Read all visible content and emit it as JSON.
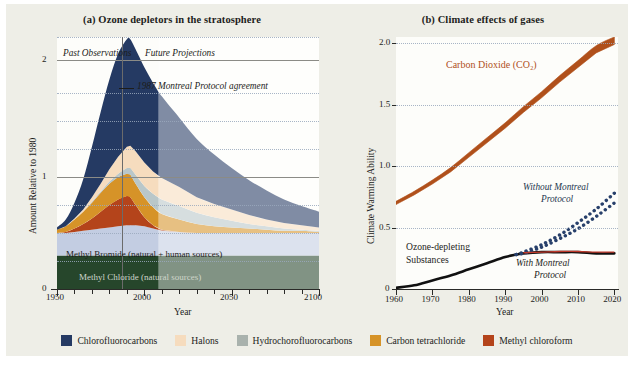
{
  "figure": {
    "background": "#eeeee7",
    "plot_background": "#fdfdfa"
  },
  "panel_a": {
    "title": "(a) Ozone depletors in the stratosphere",
    "xlabel": "Year",
    "ylabel": "Amount Relative to 1980",
    "annotations": {
      "past": "Past Observations",
      "future": "Future Projections",
      "protocol": "1987 Montreal Protocol agreement",
      "methyl_bromide": "Methyl Bromide (natural + human sources)",
      "methyl_chloride": "Methyl Chloride (natural sources)"
    },
    "divider_year": 1987,
    "projection_start_year": 2008
  },
  "panel_b": {
    "title": "(b) Climate effects of gases",
    "xlabel": "Year",
    "ylabel": "Climate Warming Ability",
    "annotations": {
      "co2": "Carbon Dioxide (CO₂)",
      "co2_color": "#b0501b",
      "without": "Without Montreal",
      "without2": "Protocol",
      "with": "With Montreal",
      "with2": "Protocol",
      "ods": "Ozone-depleting",
      "ods2": "Substances"
    }
  },
  "legend": [
    {
      "label": "Chlorofluorocarbons",
      "color": "#253a63"
    },
    {
      "label": "Halons",
      "color": "#f6dcbe"
    },
    {
      "label": "Hydrochorofluorocarbons",
      "color": "#a9b2ad"
    },
    {
      "label": "Carbon tetrachloride",
      "color": "#d69328"
    },
    {
      "label": "Methyl chloroform",
      "color": "#b4441b"
    }
  ],
  "chart_data": [
    {
      "type": "area",
      "stacked": true,
      "title": "(a) Ozone depletors in the stratosphere",
      "xlabel": "Year",
      "ylabel": "Amount Relative to 1980",
      "xlim": [
        1950,
        2100
      ],
      "ylim": [
        0,
        2.25
      ],
      "xticks": [
        1950,
        2000,
        2050,
        2100
      ],
      "xticks_minor_step": 10,
      "yticks": [
        0,
        1,
        2
      ],
      "ygrid_dotted": [
        0.25,
        0.5,
        0.75,
        1.25,
        1.5,
        1.75,
        2.25
      ],
      "grid": true,
      "legend_position": "below-figure",
      "x": [
        1950,
        1955,
        1960,
        1965,
        1970,
        1975,
        1980,
        1985,
        1990,
        1992,
        1995,
        2000,
        2005,
        2010,
        2020,
        2030,
        2040,
        2050,
        2060,
        2070,
        2080,
        2090,
        2100
      ],
      "series": [
        {
          "name": "Methyl Chloride (natural sources)",
          "color": "#26462b",
          "values": [
            0.3,
            0.3,
            0.3,
            0.3,
            0.3,
            0.3,
            0.3,
            0.3,
            0.3,
            0.3,
            0.3,
            0.3,
            0.3,
            0.3,
            0.3,
            0.3,
            0.3,
            0.3,
            0.3,
            0.3,
            0.3,
            0.3,
            0.3
          ]
        },
        {
          "name": "Methyl Bromide (natural + human sources)",
          "color": "#c3cde2",
          "values": [
            0.2,
            0.2,
            0.21,
            0.22,
            0.23,
            0.24,
            0.25,
            0.26,
            0.27,
            0.27,
            0.27,
            0.26,
            0.24,
            0.22,
            0.21,
            0.2,
            0.2,
            0.2,
            0.2,
            0.2,
            0.2,
            0.2,
            0.2
          ]
        },
        {
          "name": "Methyl chloroform",
          "color": "#b4441b",
          "values": [
            0.0,
            0.01,
            0.03,
            0.06,
            0.1,
            0.15,
            0.2,
            0.24,
            0.26,
            0.25,
            0.18,
            0.08,
            0.03,
            0.01,
            0.0,
            0.0,
            0.0,
            0.0,
            0.0,
            0.0,
            0.0,
            0.0,
            0.0
          ]
        },
        {
          "name": "Carbon tetrachloride",
          "color": "#d69328",
          "values": [
            0.03,
            0.05,
            0.08,
            0.11,
            0.14,
            0.17,
            0.19,
            0.2,
            0.2,
            0.2,
            0.19,
            0.18,
            0.16,
            0.14,
            0.11,
            0.08,
            0.06,
            0.05,
            0.04,
            0.03,
            0.02,
            0.02,
            0.01
          ]
        },
        {
          "name": "Hydrochorofluorocarbons",
          "color": "#b9c7c9",
          "values": [
            0.0,
            0.0,
            0.0,
            0.0,
            0.01,
            0.01,
            0.02,
            0.03,
            0.05,
            0.06,
            0.08,
            0.1,
            0.12,
            0.13,
            0.12,
            0.1,
            0.08,
            0.06,
            0.04,
            0.03,
            0.02,
            0.01,
            0.01
          ]
        },
        {
          "name": "Halons",
          "color": "#f6dcbe",
          "values": [
            0.0,
            0.0,
            0.01,
            0.02,
            0.04,
            0.07,
            0.11,
            0.15,
            0.19,
            0.2,
            0.21,
            0.21,
            0.2,
            0.19,
            0.17,
            0.14,
            0.12,
            0.1,
            0.08,
            0.06,
            0.05,
            0.04,
            0.03
          ]
        },
        {
          "name": "Chlorofluorocarbons",
          "color": "#253a63",
          "values": [
            0.02,
            0.06,
            0.14,
            0.27,
            0.45,
            0.64,
            0.8,
            0.92,
            0.96,
            0.95,
            0.91,
            0.85,
            0.79,
            0.73,
            0.62,
            0.52,
            0.44,
            0.37,
            0.31,
            0.26,
            0.21,
            0.17,
            0.14
          ]
        }
      ]
    },
    {
      "type": "line",
      "title": "(b) Climate effects of gases",
      "xlabel": "Year",
      "ylabel": "Climate Warming Ability",
      "xlim": [
        1960,
        2021
      ],
      "ylim": [
        0,
        2.05
      ],
      "xticks": [
        1960,
        1970,
        1980,
        1990,
        2000,
        2010,
        2020
      ],
      "yticks": [
        0,
        0.5,
        1.0,
        1.5,
        2.0
      ],
      "ygrid_dotted": [
        0.5,
        1.0,
        1.5,
        2.0
      ],
      "grid": true,
      "series": [
        {
          "name": "Carbon Dioxide (CO2)",
          "color": "#b0501b",
          "style": "band",
          "x": [
            1960,
            1965,
            1970,
            1975,
            1980,
            1985,
            1990,
            1995,
            2000,
            2005,
            2010,
            2015,
            2020
          ],
          "values": [
            0.7,
            0.78,
            0.87,
            0.97,
            1.09,
            1.21,
            1.33,
            1.46,
            1.58,
            1.71,
            1.83,
            1.95,
            2.02
          ]
        },
        {
          "name": "Ozone-depleting Substances (With Montreal Protocol)",
          "color": "#111111",
          "style": "solid",
          "x": [
            1960,
            1965,
            1970,
            1975,
            1980,
            1985,
            1990,
            1993,
            1995,
            2000,
            2005,
            2010,
            2015,
            2020
          ],
          "values": [
            0.01,
            0.03,
            0.07,
            0.11,
            0.16,
            0.21,
            0.26,
            0.28,
            0.29,
            0.3,
            0.3,
            0.3,
            0.29,
            0.29
          ]
        },
        {
          "name": "Without Montreal Protocol (upper)",
          "color": "#28406b",
          "style": "dotted",
          "x": [
            1993,
            1995,
            2000,
            2005,
            2010,
            2015,
            2020
          ],
          "values": [
            0.28,
            0.3,
            0.36,
            0.44,
            0.54,
            0.65,
            0.78
          ]
        },
        {
          "name": "Without Montreal Protocol (lower)",
          "color": "#28406b",
          "style": "dotted",
          "x": [
            1993,
            1995,
            2000,
            2005,
            2010,
            2015,
            2020
          ],
          "values": [
            0.28,
            0.29,
            0.34,
            0.41,
            0.49,
            0.59,
            0.7
          ]
        },
        {
          "name": "With Montreal Protocol (red)",
          "color": "#c0392b",
          "style": "solid-thin",
          "x": [
            1995,
            2000,
            2005,
            2010,
            2015,
            2020
          ],
          "values": [
            0.295,
            0.3,
            0.305,
            0.305,
            0.3,
            0.3
          ]
        }
      ]
    }
  ]
}
